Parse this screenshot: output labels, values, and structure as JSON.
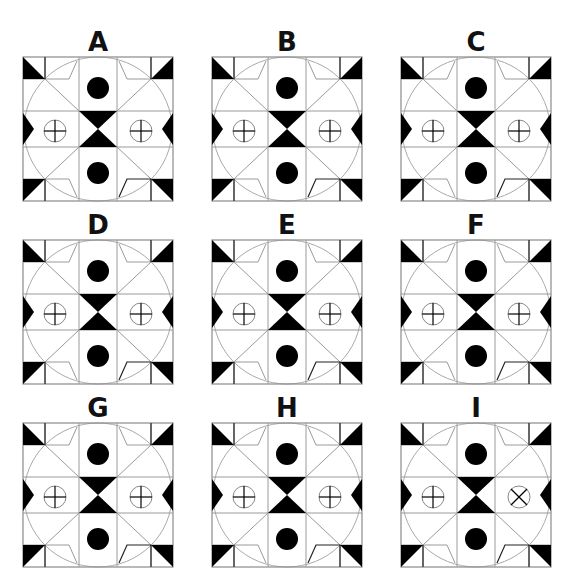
{
  "puzzle": {
    "panels": [
      {
        "id": "A",
        "label": "A",
        "left": 22,
        "top": 28,
        "right_symbol": "plus"
      },
      {
        "id": "B",
        "label": "B",
        "left": 211,
        "top": 28,
        "right_symbol": "plus"
      },
      {
        "id": "C",
        "label": "C",
        "left": 400,
        "top": 28,
        "right_symbol": "plus"
      },
      {
        "id": "D",
        "label": "D",
        "left": 22,
        "top": 211,
        "right_symbol": "plus"
      },
      {
        "id": "E",
        "label": "E",
        "left": 211,
        "top": 211,
        "right_symbol": "plus"
      },
      {
        "id": "F",
        "label": "F",
        "left": 400,
        "top": 211,
        "right_symbol": "plus"
      },
      {
        "id": "G",
        "label": "G",
        "left": 22,
        "top": 394,
        "right_symbol": "plus"
      },
      {
        "id": "H",
        "label": "H",
        "left": 211,
        "top": 394,
        "right_symbol": "plus"
      },
      {
        "id": "I",
        "label": "I",
        "left": 400,
        "top": 394,
        "right_symbol": "cross"
      }
    ],
    "colors": {
      "ink": "#000000",
      "grid": "#9a9a9a",
      "circle": "#aaaaaa",
      "background": "#ffffff"
    }
  }
}
